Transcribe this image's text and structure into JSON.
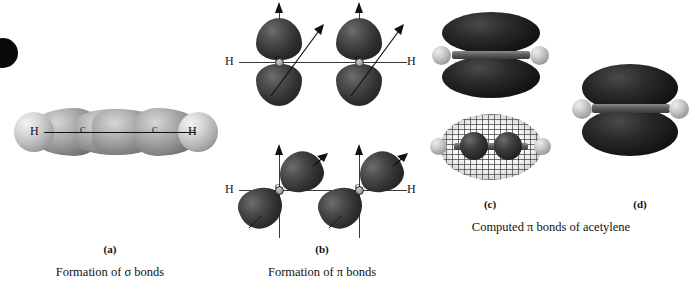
{
  "figure": {
    "overall_caption": "Computed π bonds of acetylene",
    "molecule": "acetylene",
    "background_color": "#ffffff",
    "corner_mark": "black-dot"
  },
  "panels": [
    {
      "key": "a",
      "label": "(a)",
      "caption": "Formation of σ bonds",
      "atom_labels": [
        "H",
        "C",
        "C",
        "H"
      ],
      "description": "sp hybrid orbital overlap along the internuclear axis"
    },
    {
      "key": "b",
      "label": "(b)",
      "caption": "Formation of π bonds",
      "atom_labels": [
        "H",
        "C",
        "C",
        "H"
      ],
      "description": "two perpendicular p orbital pairs forming two pi bonds"
    },
    {
      "key": "c",
      "label": "(c)",
      "caption": "",
      "description": "computed pi bond isosurface, solid and wireframe views"
    },
    {
      "key": "d",
      "label": "(d)",
      "caption": "",
      "description": "computed pi bond isosurface, rotated view"
    }
  ],
  "labels": {
    "h": "H",
    "c": "C"
  },
  "colors": {
    "orbital_dark": "#1b1b1b",
    "orbital_light": "#b0b0b0",
    "hydrogen": "#cfcfcf",
    "text": "#111111",
    "axis": "#3a3a3a"
  }
}
